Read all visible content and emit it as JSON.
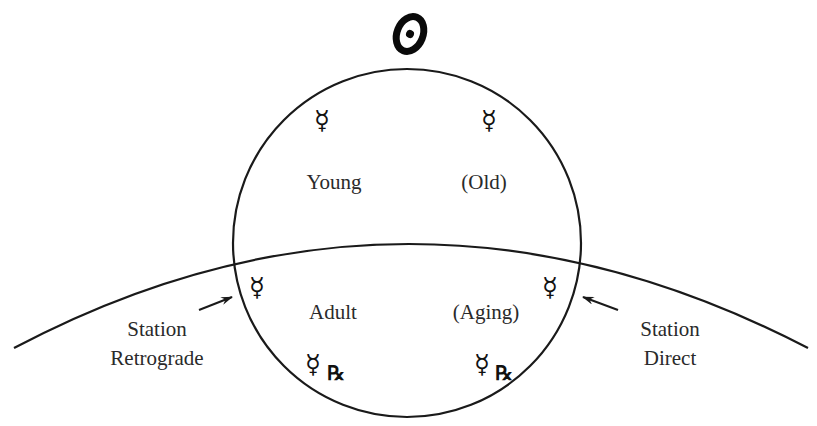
{
  "diagram": {
    "title_symbol": {
      "name": "sun-icon",
      "description": "Sun symbol (circle with dot), drawn as a tilted oval"
    },
    "phases": [
      {
        "label": "Young",
        "quadrant": "upper-left",
        "symbol": "mercury",
        "retrograde": false
      },
      {
        "label": "(Old)",
        "quadrant": "upper-right",
        "symbol": "mercury",
        "retrograde": false
      },
      {
        "label": "Adult",
        "quadrant": "lower-left",
        "symbol": "mercury",
        "retrograde": true
      },
      {
        "label": "(Aging)",
        "quadrant": "lower-right",
        "symbol": "mercury",
        "retrograde": true
      }
    ],
    "stations": [
      {
        "line1": "Station",
        "line2": "Retrograde",
        "side": "left",
        "symbol": "mercury"
      },
      {
        "line1": "Station",
        "line2": "Direct",
        "side": "right",
        "symbol": "mercury"
      }
    ],
    "glyphs": {
      "mercury": "☿",
      "retrograde": "℞"
    },
    "colors": {
      "line": "#1a1a1a",
      "text": "#2a2a2a",
      "background": "#ffffff"
    }
  }
}
